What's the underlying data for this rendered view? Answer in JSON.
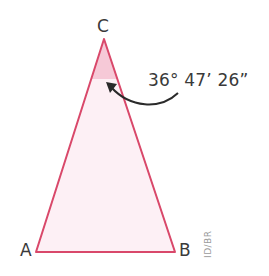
{
  "diagram": {
    "type": "isosceles-triangle",
    "vertices": {
      "A": {
        "label": "A"
      },
      "B": {
        "label": "B"
      },
      "C": {
        "label": "C"
      }
    },
    "angle_C": {
      "label": "36° 47′ 26″",
      "display": "36° 47’ 26”"
    },
    "credit": "ID/BR",
    "colors": {
      "outline": "#d9486a",
      "fill": "#fdf0f5",
      "angle_fill": "#f6c9d7",
      "text": "#3a3a3a",
      "arrow": "#2a2a2a"
    }
  }
}
